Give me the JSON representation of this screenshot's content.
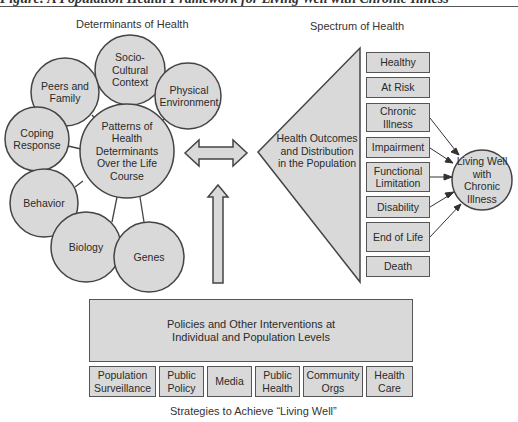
{
  "caption": "Figure: A Population Health Framework for Living Well with Chronic Illness",
  "determinants": {
    "title": "Determinants of Health",
    "center": "Patterns of Health Determinants Over the Life Course",
    "items": [
      {
        "label": "Socio-Cultural Context"
      },
      {
        "label": "Peers and Family"
      },
      {
        "label": "Physical Environment"
      },
      {
        "label": "Coping Response"
      },
      {
        "label": "Behavior"
      },
      {
        "label": "Biology"
      },
      {
        "label": "Genes"
      }
    ]
  },
  "spectrum": {
    "title": "Spectrum of Health",
    "triangle_label": "Health Outcomes and Distribution in the Population",
    "stages": [
      {
        "label": "Healthy"
      },
      {
        "label": "At Risk"
      },
      {
        "label": "Chronic Illness"
      },
      {
        "label": "Impairment"
      },
      {
        "label": "Functional Limitation"
      },
      {
        "label": "Disability"
      },
      {
        "label": "End of Life"
      },
      {
        "label": "Death"
      }
    ],
    "outcome": "Living Well with Chronic Illness"
  },
  "interventions": {
    "main": "Policies and Other Interventions at Individual and Population Levels",
    "strategies": [
      {
        "label": "Population Surveillance"
      },
      {
        "label": "Public Policy"
      },
      {
        "label": "Media"
      },
      {
        "label": "Public Health"
      },
      {
        "label": "Community Orgs"
      },
      {
        "label": "Health Care"
      }
    ],
    "footer": "Strategies to Achieve “Living Well”"
  },
  "colors": {
    "fill": "#d9d9d9",
    "stroke": "#555555",
    "background": "#ffffff"
  }
}
